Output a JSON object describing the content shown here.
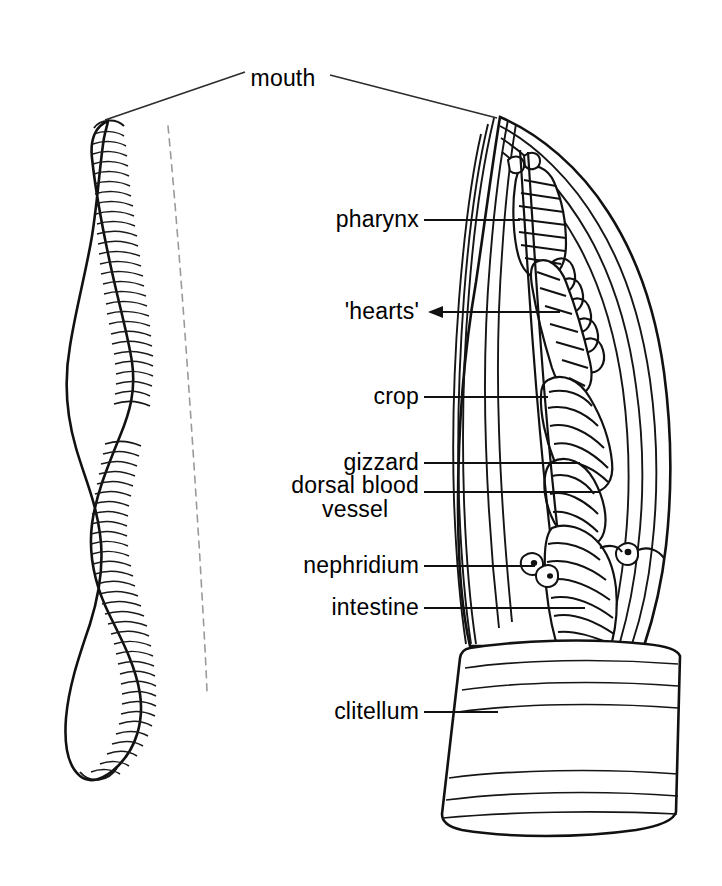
{
  "figure": {
    "title_present": false,
    "background": "#ffffff",
    "ink_color": "#111111",
    "width": 722,
    "height": 886
  },
  "labels": [
    {
      "id": "mouth",
      "text": "mouth",
      "x": 283,
      "y": 79,
      "align": "center"
    },
    {
      "id": "pharynx",
      "text": "pharynx",
      "x": 419,
      "y": 220,
      "align": "right"
    },
    {
      "id": "hearts",
      "text": "'hearts'",
      "x": 419,
      "y": 312,
      "align": "right"
    },
    {
      "id": "crop",
      "text": "crop",
      "x": 419,
      "y": 397,
      "align": "right"
    },
    {
      "id": "gizzard",
      "text": "gizzard",
      "x": 419,
      "y": 463,
      "align": "right"
    },
    {
      "id": "nephridium",
      "text": "nephridium",
      "x": 419,
      "y": 566,
      "align": "right"
    },
    {
      "id": "intestine",
      "text": "intestine",
      "x": 419,
      "y": 608,
      "align": "right"
    },
    {
      "id": "clitellum",
      "text": "clitellum",
      "x": 419,
      "y": 712,
      "align": "right"
    }
  ],
  "label_two_line": {
    "id": "dorsal-blood-vessel",
    "line1": "dorsal  blood",
    "line2": "vessel",
    "x": 419,
    "y": 498
  },
  "leaders": [
    {
      "id": "leader-mouth-left",
      "d": "M 245 72 L 105 120"
    },
    {
      "id": "leader-mouth-right",
      "d": "M 330 75 L 497 118"
    },
    {
      "id": "leader-pharynx",
      "d": "M 424 220 L 520 220"
    },
    {
      "id": "leader-hearts",
      "d": "M 424 312 L 560 312"
    },
    {
      "id": "leader-crop",
      "d": "M 424 397 L 548 397"
    },
    {
      "id": "leader-gizzard",
      "d": "M 424 463 L 580 463"
    },
    {
      "id": "leader-dorsal",
      "d": "M 424 492 L 600 492"
    },
    {
      "id": "leader-nephridium",
      "d": "M 424 566 L 535 566"
    },
    {
      "id": "leader-intestine",
      "d": "M 424 608 L 585 608"
    },
    {
      "id": "leader-clitellum",
      "d": "M 424 712 L 498 712"
    }
  ],
  "whole_worm": {
    "id": "whole-worm-figure",
    "description": "lateral view of entire earthworm, S-curved body with segment rings",
    "segment_ring_count": 62,
    "clitellum_band": {
      "present": true,
      "smooth": true
    }
  },
  "dissection": {
    "id": "dissection-figure",
    "description": "enlarged dissected anterior end showing internal organs",
    "structures": [
      "body wall",
      "pharynx",
      "hearts",
      "crop",
      "gizzard",
      "dorsal blood vessel",
      "nephridium",
      "intestine",
      "clitellum"
    ]
  }
}
